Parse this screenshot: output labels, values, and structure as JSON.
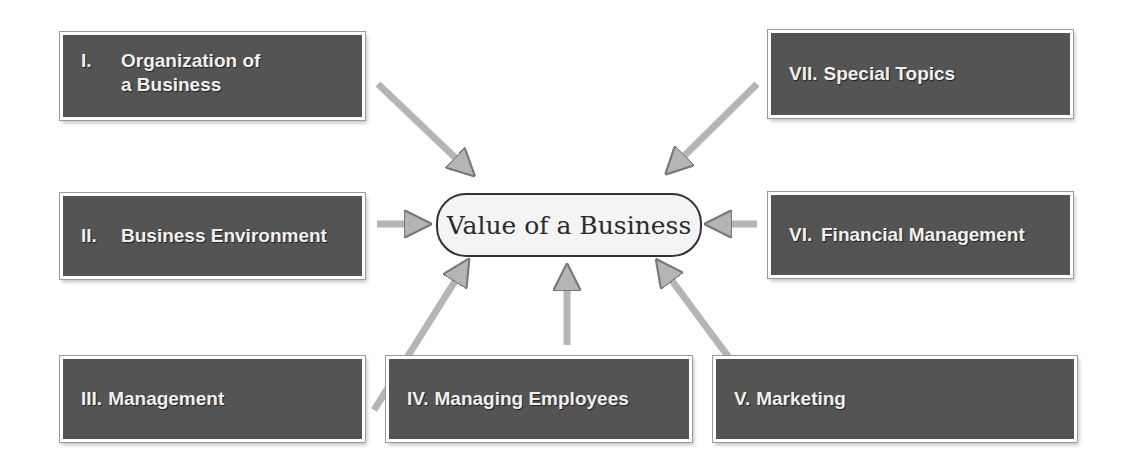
{
  "center": {
    "label": "Value of a Business"
  },
  "boxes": [
    {
      "id": "I",
      "numeral": "I.",
      "label_line1": "Organization of",
      "label_line2": "a Business"
    },
    {
      "id": "II",
      "numeral": "II.",
      "label": "Business Environment"
    },
    {
      "id": "III",
      "numeral": "III.",
      "label": "Management"
    },
    {
      "id": "IV",
      "numeral": "IV.",
      "label": "Managing Employees"
    },
    {
      "id": "V",
      "numeral": "V.",
      "label": "Marketing"
    },
    {
      "id": "VI",
      "numeral": "VI.",
      "label": "Financial Management"
    },
    {
      "id": "VII",
      "numeral": "VII.",
      "label": "Special Topics"
    }
  ],
  "colors": {
    "box_fill": "#545454",
    "arrow_fill": "#b5b5b5",
    "center_fill": "#f4f4f4"
  }
}
